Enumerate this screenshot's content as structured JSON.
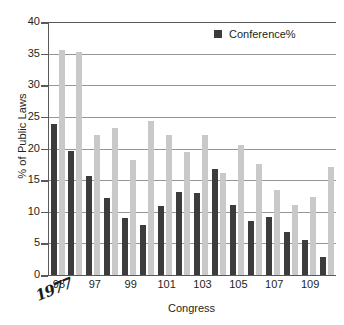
{
  "chart_data": {
    "type": "bar",
    "title": "",
    "xlabel": "Congress",
    "ylabel": "% of Public Laws",
    "ylim": [
      0,
      40
    ],
    "yticks": [
      0,
      5,
      10,
      15,
      20,
      25,
      30,
      35,
      40
    ],
    "grid": true,
    "legend_position": "top-right",
    "categories": [
      "95",
      "96",
      "97",
      "98",
      "99",
      "100",
      "101",
      "102",
      "103",
      "104",
      "105",
      "106",
      "107",
      "108",
      "109",
      "110"
    ],
    "xtick_labels": [
      "95",
      "97",
      "99",
      "101",
      "103",
      "105",
      "107",
      "109"
    ],
    "series": [
      {
        "name": "Conference%",
        "color": "#3c3c3c",
        "values": [
          23.8,
          19.6,
          15.6,
          12.2,
          9.0,
          7.9,
          10.9,
          13.2,
          13.0,
          16.7,
          11.0,
          8.6,
          9.1,
          6.8,
          5.5,
          2.9
        ]
      },
      {
        "name": "",
        "color": "#c9c9c9",
        "values": [
          35.5,
          35.2,
          22.1,
          23.2,
          18.2,
          24.4,
          22.2,
          19.5,
          22.2,
          16.2,
          20.5,
          17.6,
          13.4,
          11.1,
          12.3,
          17.0
        ]
      }
    ],
    "annotations": [
      {
        "text": "1977",
        "near": "95",
        "style": "handwritten"
      }
    ]
  },
  "legend": {
    "entries": [
      {
        "label": "Conference%",
        "swatch": "legend-swatch-dark"
      }
    ]
  },
  "axis": {
    "y_title": "% of Public Laws",
    "x_title": "Congress"
  },
  "colors": {
    "series_dark": "#3c3c3c",
    "series_light": "#c9c9c9",
    "gridline": "#939598",
    "axis": "#58595b",
    "text": "#231f20",
    "background": "#ffffff"
  },
  "annotation": {
    "handwritten_year": "1977"
  }
}
